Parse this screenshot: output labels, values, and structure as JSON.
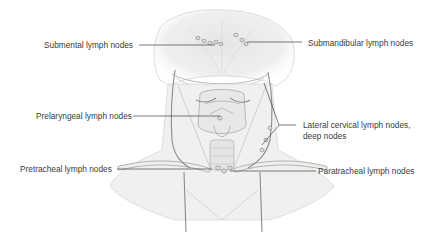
{
  "diagram": {
    "colors": {
      "background": "#ffffff",
      "text": "#3a3a3a",
      "leader_line": "#444444",
      "anatomy_line": "#9a9a9a",
      "anatomy_fill": "#eeeeee",
      "vessel": "#8c8c8c"
    },
    "labels": [
      {
        "id": "submental",
        "text": "Submental lymph nodes",
        "side": "left"
      },
      {
        "id": "submandibular",
        "text": "Submandibular lymph nodes",
        "side": "right"
      },
      {
        "id": "prelaryngeal",
        "text": "Prelaryngeal lymph nodes",
        "side": "left"
      },
      {
        "id": "lateral-cervical-1",
        "text": "Lateral cervical lymph nodes,",
        "side": "right"
      },
      {
        "id": "lateral-cervical-2",
        "text": "deep nodes",
        "side": "right"
      },
      {
        "id": "pretracheal",
        "text": "Pretracheal lymph nodes",
        "side": "left"
      },
      {
        "id": "paratracheal",
        "text": "Paratracheal lymph nodes",
        "side": "right"
      }
    ]
  }
}
